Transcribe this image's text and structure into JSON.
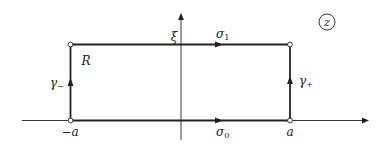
{
  "diagram": {
    "colors": {
      "stroke": "#222222",
      "background": "#ffffff"
    },
    "plane_label": "z",
    "region_label": "R",
    "axis_labels": {
      "vertical": "ξ"
    },
    "corner_labels": {
      "left": "−a",
      "right": "a"
    },
    "edges": {
      "bottom": {
        "symbol": "σ",
        "subscript": "0",
        "direction": "right"
      },
      "top": {
        "symbol": "σ",
        "subscript": "1",
        "direction": "right"
      },
      "left": {
        "symbol": "γ",
        "subscript": "−",
        "direction": "up"
      },
      "right": {
        "symbol": "γ",
        "subscript": "+",
        "direction": "up"
      }
    },
    "corners": [
      "(-a, 0)",
      "(a, 0)",
      "(a, ξ)",
      "(-a, ξ)"
    ]
  }
}
